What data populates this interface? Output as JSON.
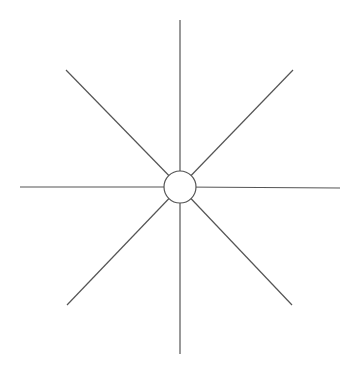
{
  "diagram": {
    "type": "star-burst",
    "background": "#ffffff",
    "stroke_color": "#555555",
    "stroke_width": 1.2,
    "center": {
      "x": 180,
      "y": 187
    },
    "hub": {
      "radius": 16,
      "fill": "#ffffff"
    },
    "spokes": [
      {
        "name": "north",
        "x2": 180,
        "y2": 20
      },
      {
        "name": "north-east",
        "x2": 293,
        "y2": 70
      },
      {
        "name": "east",
        "x2": 340,
        "y2": 188
      },
      {
        "name": "south-east",
        "x2": 292,
        "y2": 305
      },
      {
        "name": "south",
        "x2": 180,
        "y2": 354
      },
      {
        "name": "south-west",
        "x2": 67,
        "y2": 305
      },
      {
        "name": "west",
        "x2": 20,
        "y2": 187
      },
      {
        "name": "north-west",
        "x2": 66,
        "y2": 70
      }
    ]
  }
}
